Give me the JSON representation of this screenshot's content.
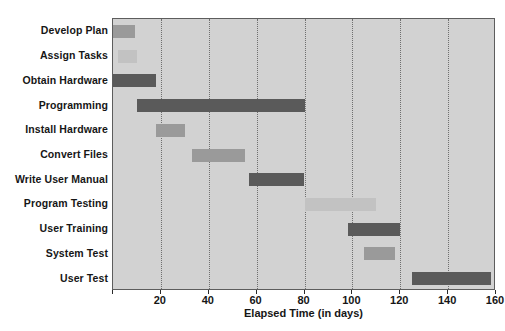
{
  "chart_data": {
    "type": "bar",
    "subtype": "gantt",
    "title": "",
    "xlabel": "Elapsed Time (in days)",
    "ylabel": "",
    "xlim": [
      0,
      160
    ],
    "xticks": [
      0,
      20,
      40,
      60,
      80,
      100,
      120,
      140,
      160
    ],
    "xtick_labels": [
      "",
      "20",
      "40",
      "60",
      "80",
      "100",
      "120",
      "140",
      "160"
    ],
    "grid": "vertical-dotted",
    "legend": "none",
    "plot_background": "#d2d2d2",
    "colors": {
      "dark": "#5a5a5a",
      "medium": "#9a9a9a",
      "light": "#c2c2c2",
      "border": "#5d5d5d",
      "gridline": "#6f6f6f"
    },
    "categories": [
      "Develop Plan",
      "Assign Tasks",
      "Obtain Hardware",
      "Programming",
      "Install Hardware",
      "Convert Files",
      "Write User Manual",
      "Program Testing",
      "User Training",
      "System Test",
      "User Test"
    ],
    "tasks": [
      {
        "label": "Develop Plan",
        "start": 0,
        "end": 9,
        "duration": 9,
        "shade": "medium"
      },
      {
        "label": "Assign Tasks",
        "start": 2,
        "end": 10,
        "duration": 8,
        "shade": "light"
      },
      {
        "label": "Obtain Hardware",
        "start": 0,
        "end": 18,
        "duration": 18,
        "shade": "dark"
      },
      {
        "label": "Programming",
        "start": 10,
        "end": 80,
        "duration": 70,
        "shade": "dark"
      },
      {
        "label": "Install Hardware",
        "start": 18,
        "end": 30,
        "duration": 12,
        "shade": "medium"
      },
      {
        "label": "Convert Files",
        "start": 33,
        "end": 55,
        "duration": 22,
        "shade": "medium"
      },
      {
        "label": "Write User Manual",
        "start": 57,
        "end": 80,
        "duration": 23,
        "shade": "dark"
      },
      {
        "label": "Program Testing",
        "start": 80,
        "end": 110,
        "duration": 30,
        "shade": "light"
      },
      {
        "label": "User Training",
        "start": 98,
        "end": 120,
        "duration": 22,
        "shade": "dark"
      },
      {
        "label": "System Test",
        "start": 105,
        "end": 118,
        "duration": 13,
        "shade": "medium"
      },
      {
        "label": "User Test",
        "start": 125,
        "end": 158,
        "duration": 33,
        "shade": "dark"
      }
    ]
  }
}
